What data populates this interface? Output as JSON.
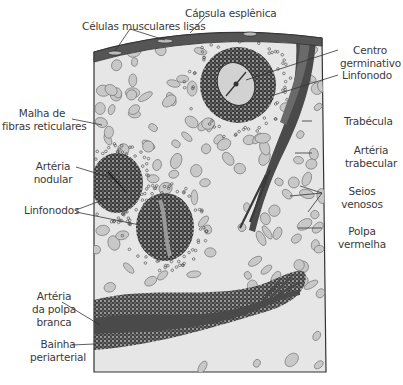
{
  "figure": {
    "colors": {
      "capsule": "#555555",
      "tissue_bg": "#e6e6e6",
      "cell_fill": "#c8c8c8",
      "cell_stroke": "#6a6a6a",
      "lymph_dark": "#2a2a2a",
      "artery": "#4a4a4a",
      "leader_line": "#333333",
      "label_text": "#3a3a3a"
    },
    "labels": {
      "capsula": "Cápsula esplênica",
      "celulas": "Células musculares lisas",
      "centro_l1": "Centro",
      "centro_l2": "germinativo",
      "linfonodo": "Linfonodo",
      "malha_l1": "Malha de",
      "malha_l2": "fibras reticulares",
      "trabecula": "Trabécula",
      "art_trab_l1": "Artéria",
      "art_trab_l2": "trabecular",
      "art_nod_l1": "Artéria",
      "art_nod_l2": "nodular",
      "seios_l1": "Seios",
      "seios_l2": "venosos",
      "linfonodos": "Linfonodos",
      "polpa_l1": "Polpa",
      "polpa_l2": "vermelha",
      "art_pb_l1": "Artéria",
      "art_pb_l2": "da polpa",
      "art_pb_l3": "branca",
      "bainha_l1": "Bainha",
      "bainha_l2": "periarterial"
    }
  }
}
